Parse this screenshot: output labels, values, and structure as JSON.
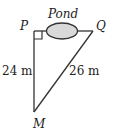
{
  "diagram": {
    "points": {
      "P": {
        "label": "P"
      },
      "Q": {
        "label": "Q"
      },
      "M": {
        "label": "M"
      }
    },
    "pond_label": "Pond",
    "sides": {
      "PM": "24 m",
      "QM": "26 m"
    },
    "right_angle_at": "P",
    "colors": {
      "line": "#333333",
      "pond_fill": "#d9d9d9",
      "pond_stroke": "#333333"
    }
  }
}
